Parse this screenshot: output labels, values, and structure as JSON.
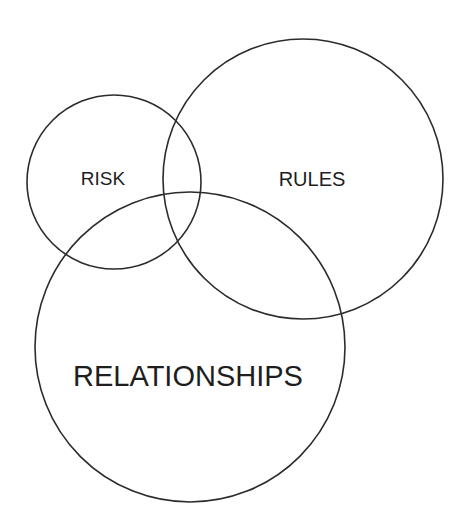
{
  "diagram": {
    "type": "venn",
    "background": "#ffffff",
    "stroke_color": "#2b2b2b",
    "text_color": "#1e1e1e",
    "sets": [
      {
        "id": "risk",
        "label": "RISK",
        "cx": 114,
        "cy": 182,
        "r": 87,
        "label_x": 103,
        "label_y": 185,
        "font_size": 19
      },
      {
        "id": "rules",
        "label": "RULES",
        "cx": 303,
        "cy": 179,
        "r": 140,
        "label_x": 312,
        "label_y": 186,
        "font_size": 20
      },
      {
        "id": "relationships",
        "label": "RELATIONSHIPS",
        "cx": 190,
        "cy": 347,
        "r": 155,
        "label_x": 188,
        "label_y": 386,
        "font_size": 29
      }
    ]
  }
}
